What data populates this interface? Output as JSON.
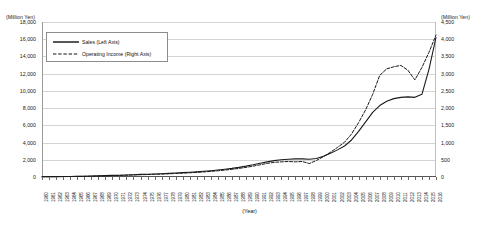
{
  "chart_data": {
    "type": "line",
    "title": "",
    "xlabel": "(Year)",
    "unit_left": "(Million Yen)",
    "unit_right": "(Million Yen)",
    "grid": true,
    "legend_position": "top-left",
    "ylim_left": [
      0,
      18000
    ],
    "ylim_right": [
      0,
      4500
    ],
    "yticks_left": [
      "0",
      "2,000",
      "4,000",
      "6,000",
      "8,000",
      "10,000",
      "12,000",
      "14,000",
      "16,000",
      "18,000"
    ],
    "yticks_left_values": [
      0,
      2000,
      4000,
      6000,
      8000,
      10000,
      12000,
      14000,
      16000,
      18000
    ],
    "yticks_right": [
      "0",
      "500",
      "1,000",
      "1,500",
      "2,000",
      "2,500",
      "3,000",
      "3,500",
      "4,000",
      "4,500"
    ],
    "yticks_right_values": [
      0,
      500,
      1000,
      1500,
      2000,
      2500,
      3000,
      3500,
      4000,
      4500
    ],
    "categories": [
      "1960",
      "1961",
      "1962",
      "1963",
      "1964",
      "1965",
      "1966",
      "1967",
      "1968",
      "1969",
      "1970",
      "1971",
      "1972",
      "1973",
      "1974",
      "1975",
      "1976",
      "1977",
      "1978",
      "1979",
      "1980",
      "1981",
      "1982",
      "1983",
      "1984",
      "1985",
      "1986",
      "1987",
      "1988",
      "1989",
      "1990",
      "1991",
      "1992",
      "1993",
      "1994",
      "1995",
      "1996",
      "1997",
      "1998",
      "1999",
      "2000",
      "2001",
      "2002",
      "2003",
      "2004",
      "2005",
      "2006",
      "2007",
      "2008",
      "2009",
      "2010",
      "2011",
      "2012",
      "2013",
      "2014",
      "2015",
      "2016"
    ],
    "series": [
      {
        "name": "Sales (Left Axis)",
        "axis": "left",
        "style": "solid",
        "color": "#1a1a1a",
        "values": [
          30,
          38,
          46,
          55,
          66,
          78,
          92,
          110,
          130,
          155,
          185,
          205,
          230,
          270,
          300,
          320,
          350,
          385,
          420,
          460,
          505,
          550,
          600,
          660,
          730,
          810,
          900,
          1000,
          1120,
          1260,
          1420,
          1600,
          1760,
          1900,
          2000,
          2060,
          2100,
          2100,
          2060,
          2150,
          2400,
          2750,
          3150,
          3600,
          4300,
          5300,
          6400,
          7500,
          8300,
          8800,
          9100,
          9250,
          9300,
          9250,
          9600,
          12500,
          16200
        ]
      },
      {
        "name": "Operating Income (Right Axis)",
        "axis": "right",
        "style": "dashed",
        "color": "#1a1a1a",
        "values": [
          6,
          8,
          10,
          12,
          14,
          17,
          20,
          24,
          29,
          34,
          40,
          45,
          51,
          59,
          66,
          71,
          78,
          85,
          93,
          102,
          112,
          122,
          134,
          147,
          163,
          181,
          201,
          224,
          250,
          280,
          315,
          355,
          395,
          425,
          440,
          450,
          440,
          450,
          390,
          480,
          590,
          720,
          860,
          1010,
          1250,
          1580,
          1950,
          2400,
          2950,
          3140,
          3200,
          3240,
          3100,
          2820,
          3180,
          3620,
          4120
        ]
      }
    ]
  },
  "legend": {
    "items": [
      {
        "label": "Sales (Left Axis)",
        "style": "solid"
      },
      {
        "label": "Operating Income (Right Axis)",
        "style": "dashed"
      }
    ]
  }
}
